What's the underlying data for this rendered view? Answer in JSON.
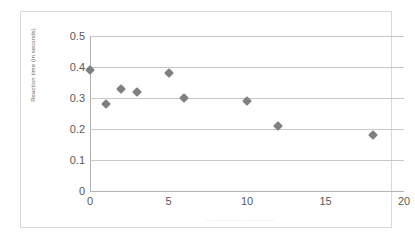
{
  "chart_data": {
    "type": "scatter",
    "title": "",
    "xlabel": "",
    "ylabel": "Reaction time (in seconds)",
    "xlim": [
      0,
      20
    ],
    "ylim": [
      0,
      0.5
    ],
    "xticks": [
      "0",
      "5",
      "10",
      "15",
      "20"
    ],
    "xtick_values": [
      0,
      5,
      10,
      15,
      20
    ],
    "yticks": [
      "0",
      "0.1",
      "0.2",
      "0.3",
      "0.4",
      "0.5"
    ],
    "ytick_values": [
      0,
      0.1,
      0.2,
      0.3,
      0.4,
      0.5
    ],
    "grid": true,
    "legend": false,
    "marker_color": "#808080",
    "marker_shape": "diamond",
    "points": [
      {
        "x": 0,
        "y": 0.39
      },
      {
        "x": 1,
        "y": 0.28
      },
      {
        "x": 2,
        "y": 0.33
      },
      {
        "x": 3,
        "y": 0.32
      },
      {
        "x": 5,
        "y": 0.38
      },
      {
        "x": 6,
        "y": 0.3
      },
      {
        "x": 10,
        "y": 0.29
      },
      {
        "x": 12,
        "y": 0.21
      },
      {
        "x": 18,
        "y": 0.18
      }
    ],
    "series": [
      {
        "name": "Series 1",
        "x": [
          0,
          1,
          2,
          3,
          5,
          6,
          10,
          12,
          18
        ],
        "values": [
          0.39,
          0.28,
          0.33,
          0.32,
          0.38,
          0.3,
          0.29,
          0.21,
          0.18
        ]
      }
    ]
  },
  "caption": {
    "text": "—  –   ––  –   –––  –    –– ––   –  –––  ––"
  },
  "colors": {
    "marker": "#808080",
    "gridline": "#c8c8c8",
    "border": "#d9d9d9",
    "tick_text": "#595959"
  }
}
